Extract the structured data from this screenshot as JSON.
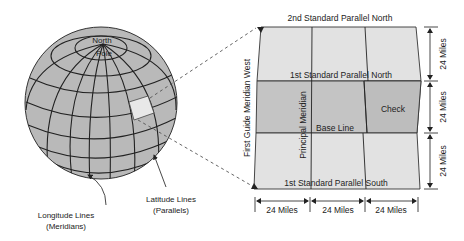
{
  "globe": {
    "pole_label_line1": "North",
    "pole_label_line2": "Pole",
    "latitude_label_line1": "Latitude Lines",
    "latitude_label_line2": "(Parallels)",
    "longitude_label_line1": "Longitude Lines",
    "longitude_label_line2": "(Meridians)"
  },
  "grid": {
    "top_label": "2nd Standard Parallel North",
    "first_parallel_north": "1st Standard Parallel North",
    "base_line": "Base Line",
    "first_parallel_south": "1st Standard Parallel South",
    "principal_meridian": "Principal Meridian",
    "guide_meridian": "First Guide Meridian West",
    "check_label": "Check"
  },
  "dimensions": {
    "vertical": [
      "24 Miles",
      "24 Miles",
      "24 Miles"
    ],
    "horizontal": [
      "24 Miles",
      "24 Miles",
      "24 Miles"
    ]
  },
  "colors": {
    "globe_fill": "#b9b9b9",
    "light_band": "#e2e2e2",
    "mid_band": "#c4c4c4",
    "check_fill": "#bdbdbd",
    "line": "#222222"
  }
}
